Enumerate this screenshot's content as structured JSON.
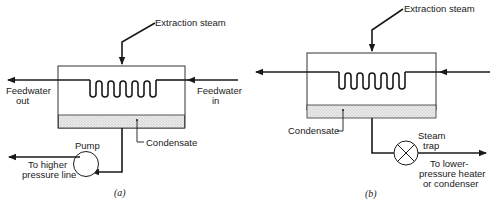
{
  "diagram_a": {
    "caption": "(a)",
    "labels": {
      "extraction_steam": "Extraction steam",
      "feedwater_out_1": "Feedwater",
      "feedwater_out_2": "out",
      "feedwater_in_1": "Feedwater",
      "feedwater_in_2": "in",
      "condensate": "Condensate",
      "pump": "Pump",
      "to_higher_1": "To higher",
      "to_higher_2": "pressure line"
    }
  },
  "diagram_b": {
    "caption": "(b)",
    "labels": {
      "extraction_steam": "Extraction steam",
      "condensate": "Condensate",
      "steam_trap_1": "Steam",
      "steam_trap_2": "trap",
      "to_lower_1": "To lower-",
      "to_lower_2": "pressure heater",
      "to_lower_3": "or condenser"
    }
  },
  "colors": {
    "line": "#1a1a1a",
    "condensate_fill": "#e6e6e6"
  }
}
